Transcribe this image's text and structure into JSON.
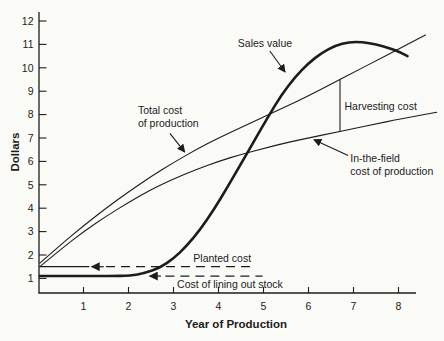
{
  "figure": {
    "background": "#fafaf7",
    "ink_color": "#1c1c1c"
  },
  "chart_data": {
    "type": "line",
    "title": "",
    "xlabel": "Year of Production",
    "ylabel": "Dollars",
    "xlim": [
      0,
      8.9
    ],
    "ylim": [
      0.6,
      12.3
    ],
    "x_ticks": [
      1,
      2,
      3,
      4,
      5,
      6,
      7,
      8
    ],
    "y_ticks": [
      1,
      2,
      3,
      4,
      5,
      6,
      7,
      8,
      9,
      10,
      11,
      12
    ],
    "grid": false,
    "legend_position": "none",
    "series": [
      {
        "name": "Sales value",
        "style": "thick",
        "points": [
          [
            0.03,
            1.1
          ],
          [
            0.8,
            1.1
          ],
          [
            1.6,
            1.1
          ],
          [
            2.05,
            1.12
          ],
          [
            2.35,
            1.22
          ],
          [
            2.7,
            1.45
          ],
          [
            3.0,
            1.85
          ],
          [
            3.3,
            2.4
          ],
          [
            3.6,
            3.1
          ],
          [
            3.9,
            3.95
          ],
          [
            4.2,
            4.9
          ],
          [
            4.5,
            5.9
          ],
          [
            4.8,
            6.9
          ],
          [
            5.1,
            7.9
          ],
          [
            5.4,
            8.85
          ],
          [
            5.7,
            9.6
          ],
          [
            6.0,
            10.2
          ],
          [
            6.3,
            10.65
          ],
          [
            6.6,
            10.95
          ],
          [
            6.9,
            11.1
          ],
          [
            7.2,
            11.1
          ],
          [
            7.5,
            11.0
          ],
          [
            7.8,
            10.85
          ],
          [
            8.05,
            10.65
          ],
          [
            8.2,
            10.5
          ]
        ]
      },
      {
        "name": "Total cost of production",
        "style": "thin",
        "points": [
          [
            0.03,
            1.65
          ],
          [
            0.5,
            2.45
          ],
          [
            1.0,
            3.25
          ],
          [
            1.5,
            4.0
          ],
          [
            2.0,
            4.7
          ],
          [
            2.5,
            5.35
          ],
          [
            3.0,
            5.95
          ],
          [
            3.5,
            6.5
          ],
          [
            4.0,
            7.0
          ],
          [
            4.5,
            7.45
          ],
          [
            5.0,
            7.9
          ],
          [
            5.5,
            8.35
          ],
          [
            6.0,
            8.8
          ],
          [
            6.5,
            9.3
          ],
          [
            7.0,
            9.8
          ],
          [
            7.5,
            10.3
          ],
          [
            8.0,
            10.8
          ],
          [
            8.6,
            11.4
          ]
        ]
      },
      {
        "name": "In-the-field cost of production",
        "style": "thin",
        "points": [
          [
            0.03,
            1.5
          ],
          [
            0.5,
            2.25
          ],
          [
            1.0,
            3.0
          ],
          [
            1.5,
            3.65
          ],
          [
            2.0,
            4.25
          ],
          [
            2.5,
            4.8
          ],
          [
            3.0,
            5.25
          ],
          [
            3.5,
            5.65
          ],
          [
            4.0,
            6.0
          ],
          [
            4.5,
            6.3
          ],
          [
            5.0,
            6.55
          ],
          [
            5.5,
            6.8
          ],
          [
            6.0,
            7.0
          ],
          [
            6.5,
            7.2
          ],
          [
            7.0,
            7.4
          ],
          [
            7.5,
            7.6
          ],
          [
            8.0,
            7.8
          ],
          [
            8.85,
            8.1
          ]
        ]
      }
    ],
    "reference_lines": [
      {
        "name": "Planted cost",
        "value": 1.5,
        "solid_from": 0.02,
        "solid_to": 1.13,
        "arrow_from": 1.45,
        "arrow_to": 1.18,
        "dash_from": 1.5,
        "dash_to": 4.73
      },
      {
        "name": "Cost of lining out stock",
        "value": 1.1,
        "arrow_from": 2.72,
        "arrow_to": 2.47,
        "dash_from": 2.82,
        "dash_to": 4.98
      }
    ],
    "harvesting_bracket": {
      "year": 6.7,
      "from_value": 7.28,
      "to_value": 9.5
    },
    "annotations": [
      {
        "id": "sales-value-label",
        "lines": [
          "Sales value"
        ],
        "x": 4.43,
        "y": 10.9,
        "arrow": {
          "x1": 5.14,
          "y1": 10.72,
          "x2": 5.48,
          "y2": 9.82
        }
      },
      {
        "id": "total-cost-label",
        "lines": [
          "Total cost",
          "of production"
        ],
        "x": 2.21,
        "y": 8.02,
        "arrow": {
          "x1": 2.92,
          "y1": 7.2,
          "x2": 3.25,
          "y2": 6.4
        }
      },
      {
        "id": "harvesting-cost-label",
        "lines": [
          "Harvesting cost"
        ],
        "x": 6.8,
        "y": 8.2
      },
      {
        "id": "in-the-field-label",
        "lines": [
          "In-the-field",
          "cost of production"
        ],
        "x": 6.93,
        "y": 5.98,
        "arrow": {
          "x1": 6.88,
          "y1": 6.25,
          "x2": 6.12,
          "y2": 6.93
        }
      },
      {
        "id": "planted-cost-label",
        "lines": [
          "Planted cost"
        ],
        "x": 3.44,
        "y": 1.72
      },
      {
        "id": "lining-cost-label",
        "lines": [
          "Cost of lining out stock"
        ],
        "x": 3.08,
        "y": 0.6
      }
    ]
  }
}
